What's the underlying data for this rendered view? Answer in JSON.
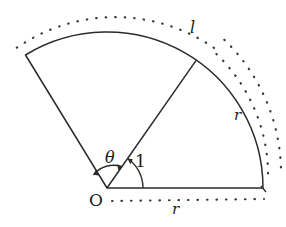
{
  "figure": {
    "kind": "circular-sector-radian-diagram",
    "background_color": "#ffffff",
    "stroke_color": "#2b2b2b",
    "labels": {
      "origin": "O",
      "angle": "θ",
      "unit_radius_angle": "1",
      "arc_length": "l",
      "radius_right": "r",
      "radius_bottom": "r"
    },
    "geometry": {
      "center_x": 107,
      "center_y": 188,
      "radius": 156,
      "sector_start_angle_deg": 0,
      "sector_end_angle_deg": 121.5,
      "inner_ray_angle_deg": 55.1,
      "theta_arc_radius": 26,
      "unit_arc_radius": 36,
      "dotted_offset_outer": 18,
      "dotted_offset_inner": 9,
      "dotted_offset_bottom": 12
    }
  }
}
